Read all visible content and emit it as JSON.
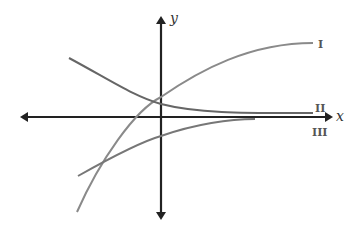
{
  "diagram": {
    "axes": {
      "x_label": "x",
      "y_label": "y",
      "axis_color": "#222222"
    },
    "curves": [
      {
        "id": "I",
        "label": "I",
        "color": "#8a8a8a",
        "description": "increasing, concave down, approaching horizontal asymptote above"
      },
      {
        "id": "II",
        "label": "II",
        "color": "#666666",
        "description": "decreasing, approaching x-axis from above"
      },
      {
        "id": "III",
        "label": "III",
        "color": "#777777",
        "description": "increasing, approaching x-axis from below"
      }
    ]
  }
}
